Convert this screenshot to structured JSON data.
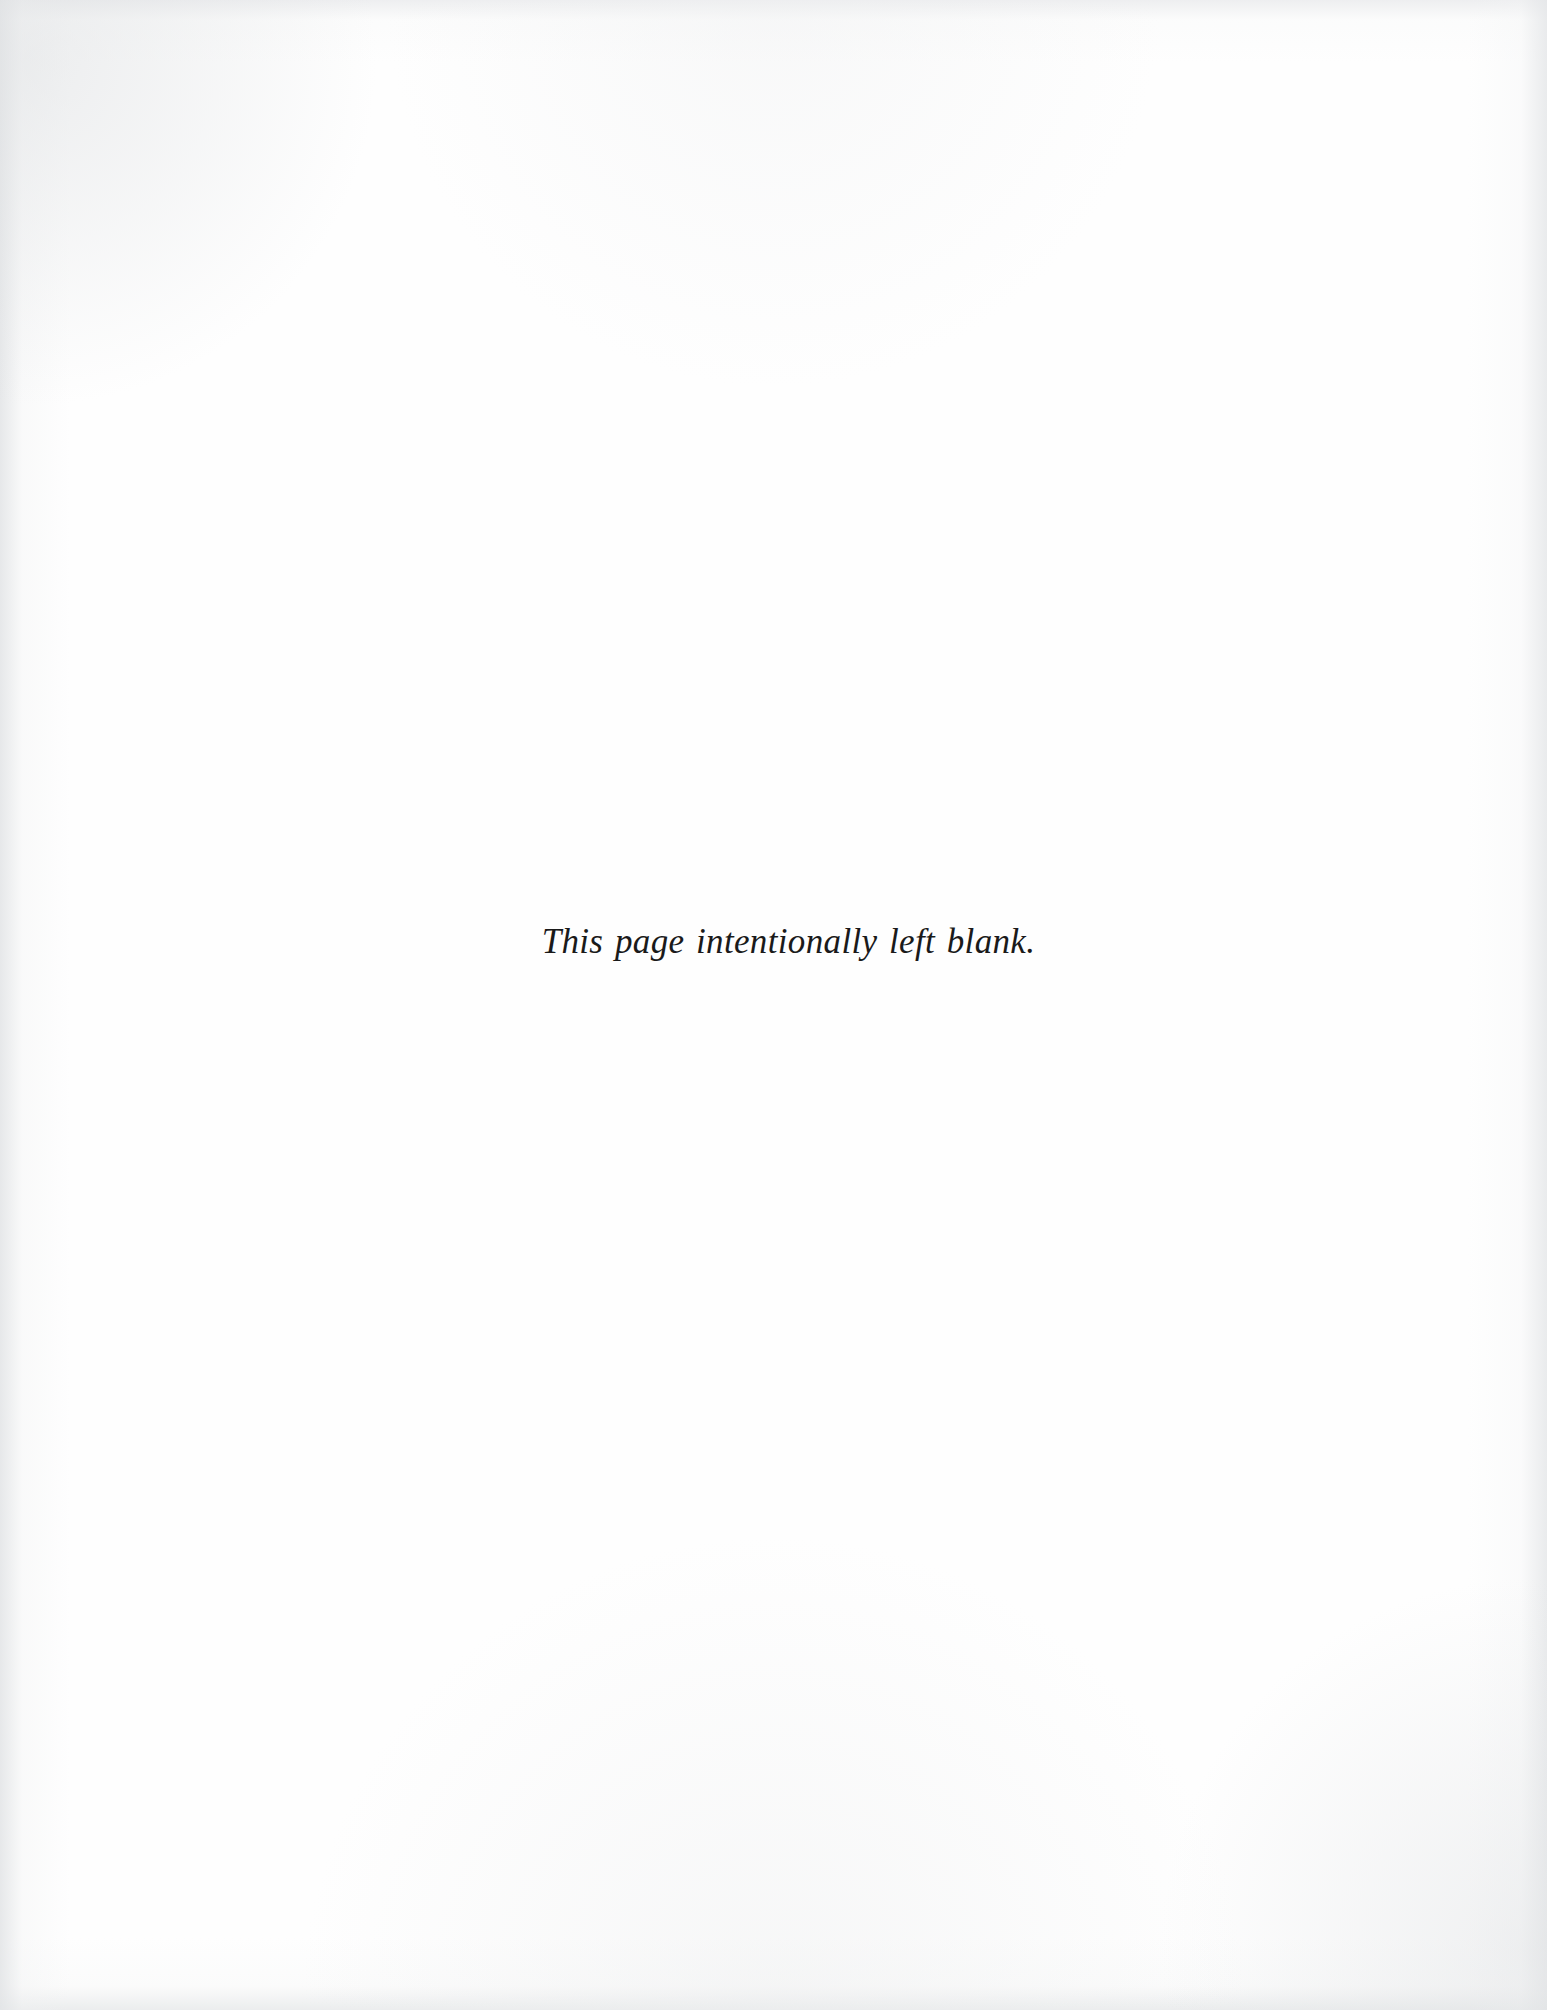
{
  "document": {
    "type": "scanned-book-page",
    "page_width_px": 1547,
    "page_height_px": 2010,
    "paper_color": "#fefefe",
    "ink_color": "#1a1a1a",
    "edge_shadow_color": "#e2e4e6"
  },
  "content": {
    "blank_notice": "This page intentionally left blank."
  }
}
